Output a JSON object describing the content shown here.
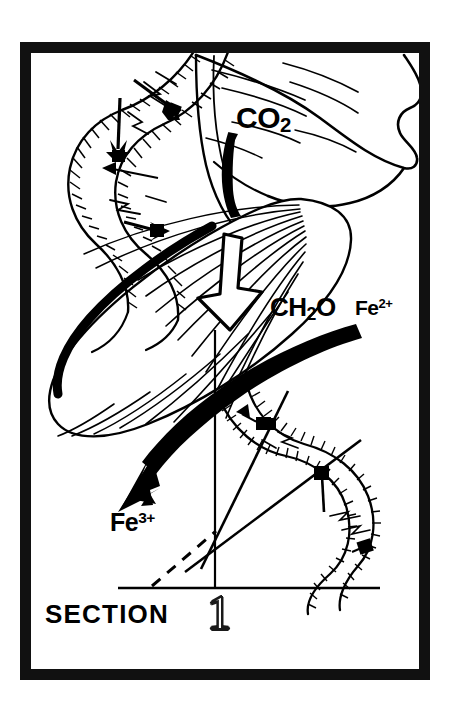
{
  "figure": {
    "kind": "scientific-schematic",
    "orientation": "portrait",
    "background_color": "#ffffff",
    "ink_color": "#000000",
    "frame": {
      "name": "black-rectangular-border",
      "color": "#000000",
      "x": 20,
      "y": 42,
      "width": 410,
      "height": 638,
      "thickness": 11
    },
    "caption": {
      "section_word": "SECTION",
      "section_number": "1",
      "number_style": "outline"
    },
    "labels": [
      {
        "id": "co2",
        "base": "CO",
        "sub": "2",
        "sup": "",
        "text": "CO2",
        "x": 236,
        "y": 103,
        "font_size": 30
      },
      {
        "id": "ch2o",
        "base": "CH",
        "sub": "2",
        "tail": "O",
        "sup": "",
        "text": "CH2O",
        "x": 270,
        "y": 294,
        "font_size": 26
      },
      {
        "id": "fe2",
        "base": "Fe",
        "sub": "",
        "sup": "2+",
        "text": "Fe2+",
        "x": 355,
        "y": 297,
        "font_size": 21
      },
      {
        "id": "fe3",
        "base": "Fe",
        "sub": "",
        "sup": "3+",
        "text": "Fe3+",
        "x": 110,
        "y": 510,
        "font_size": 25
      }
    ],
    "elements": [
      {
        "name": "dna-helix-upper-left",
        "description": "double helix with ribbed strands and internal arrow markers"
      },
      {
        "name": "dna-helix-lower-right",
        "description": "double helix with ribbed strands crossed by two straight diagonal lines"
      },
      {
        "name": "leaf-blade-central",
        "description": "large ellipse leaf with radiating vein lines and thick black upper-left edge"
      },
      {
        "name": "leaf-blade-upper-right",
        "description": "lobed wavy-edged leaf shape with sweeping vein strokes"
      },
      {
        "name": "solid-arrow-co2-down",
        "description": "thick solid black downward arrow under CO2 label"
      },
      {
        "name": "outline-arrow-down",
        "description": "hollow white outlined downward arrow pointing to CH2O"
      },
      {
        "name": "solid-arrow-fe-sweep",
        "description": "thick black curved arrow sweeping from Fe2+ down-left to Fe3+"
      },
      {
        "name": "axis-baseline-horizontal",
        "description": "horizontal rule near bottom"
      },
      {
        "name": "axis-vertical",
        "description": "vertical line rising from baseline"
      },
      {
        "name": "dashed-diagonal-line",
        "description": "dashed line rising left-to-right to the axis crossing"
      }
    ]
  }
}
